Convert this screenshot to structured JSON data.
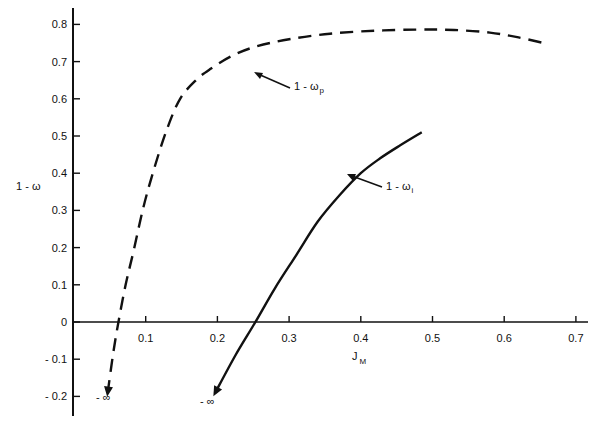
{
  "chart_data": {
    "type": "line",
    "title": "",
    "xlabel": "J",
    "xlabel_subscript": "M",
    "ylabel": "1 - ω",
    "xlim": [
      0,
      0.72
    ],
    "ylim": [
      -0.25,
      0.85
    ],
    "x_ticks": [
      0.1,
      0.2,
      0.3,
      0.4,
      0.5,
      0.6,
      0.7
    ],
    "x_tick_labels": [
      "0.1",
      "0.2",
      "0.3",
      "0.4",
      "0.5",
      "0.6",
      "0.7"
    ],
    "y_ticks": [
      0.8,
      0.7,
      0.6,
      0.5,
      0.4,
      0.3,
      0.2,
      0.1,
      0,
      -0.1,
      -0.2
    ],
    "y_tick_labels": [
      "0.8",
      "0.7",
      "0.6",
      "0.5",
      "0.4",
      "0.3",
      "0.2",
      "0.1",
      "0",
      "- 0.1",
      "- 0.2"
    ],
    "grid": false,
    "legend": "none (inline arrow annotations)",
    "series": [
      {
        "name": "1 - ω_p",
        "label_main": "1 - ω",
        "label_sub": "p",
        "style": "dashed",
        "x": [
          0.047,
          0.055,
          0.062,
          0.072,
          0.083,
          0.097,
          0.113,
          0.13,
          0.148,
          0.17,
          0.19,
          0.22,
          0.253,
          0.3,
          0.357,
          0.42,
          0.48,
          0.53,
          0.58,
          0.62,
          0.655
        ],
        "y": [
          -0.19,
          -0.08,
          0.0,
          0.1,
          0.19,
          0.31,
          0.42,
          0.52,
          0.6,
          0.65,
          0.68,
          0.715,
          0.74,
          0.76,
          0.775,
          0.783,
          0.786,
          0.785,
          0.778,
          0.765,
          0.75
        ],
        "end_annotation": "-∞"
      },
      {
        "name": "1 - ω_i",
        "label_main": "1 - ω",
        "label_sub": "i",
        "style": "solid",
        "x": [
          0.197,
          0.225,
          0.253,
          0.28,
          0.31,
          0.34,
          0.37,
          0.4,
          0.427,
          0.455,
          0.485
        ],
        "y": [
          -0.19,
          -0.09,
          0.0,
          0.09,
          0.18,
          0.27,
          0.34,
          0.4,
          0.44,
          0.475,
          0.51
        ],
        "end_annotation": "-∞"
      }
    ],
    "annotations": [
      {
        "text": "1 - ω_p",
        "points_to_series": "1 - ω_p"
      },
      {
        "text": "1 - ω_i",
        "points_to_series": "1 - ω_i"
      },
      {
        "text": "-∞",
        "near": "lower end of 1 - ω_p"
      },
      {
        "text": "-∞",
        "near": "lower end of 1 - ω_i"
      }
    ]
  },
  "labels": {
    "ylabel_text": "1 - ω",
    "xlabel_main": "J",
    "xlabel_sub": "M",
    "annot_p_main": "1 - ω",
    "annot_p_sub": "p",
    "annot_i_main": "1 - ω",
    "annot_i_sub": "i",
    "neg_inf_p": "- ∞",
    "neg_inf_i": "- ∞"
  },
  "colors": {
    "ink": "#111111",
    "background": "#ffffff"
  }
}
